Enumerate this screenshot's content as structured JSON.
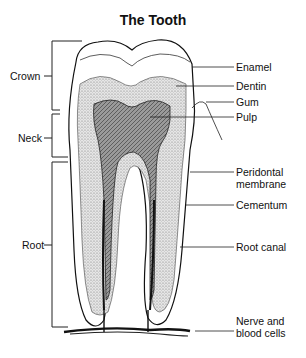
{
  "title": "The Tooth",
  "left_labels": {
    "crown": "Crown",
    "neck": "Neck",
    "root": "Root"
  },
  "right_labels": {
    "enamel": "Enamel",
    "dentin": "Dentin",
    "gum": "Gum",
    "pulp": "Pulp",
    "periodontal_1": "Peridontal",
    "periodontal_2": "membrane",
    "cementum": "Cementum",
    "root_canal": "Root canal",
    "nerve_1": "Nerve and",
    "nerve_2": "blood cells"
  }
}
